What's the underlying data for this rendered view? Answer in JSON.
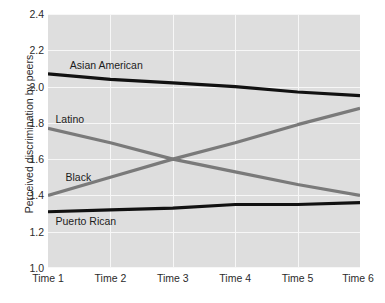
{
  "chart_data": {
    "type": "line",
    "title": "",
    "xlabel": "",
    "ylabel": "Perceived discrimination by peers",
    "categories": [
      "Time 1",
      "Time 2",
      "Time 3",
      "Time 4",
      "Time 5",
      "Time 6"
    ],
    "ylim": [
      1.0,
      2.4
    ],
    "yticks": [
      "1.0",
      "1.2",
      "1.4",
      "1.6",
      "1.8",
      "2.0",
      "2.2",
      "2.4"
    ],
    "ytick_values": [
      1.0,
      1.2,
      1.4,
      1.6,
      1.8,
      2.0,
      2.2,
      2.4
    ],
    "grid": true,
    "legend_position": "inline-labels",
    "plot_background": "#dedede",
    "gridline_color": "#f7f7f7",
    "series": [
      {
        "name": "Asian American",
        "color": "#111111",
        "values": [
          2.07,
          2.04,
          2.02,
          2.0,
          1.97,
          1.95
        ]
      },
      {
        "name": "Latino",
        "color": "#7a7a7a",
        "values": [
          1.77,
          1.69,
          1.6,
          1.53,
          1.46,
          1.4
        ]
      },
      {
        "name": "Black",
        "color": "#7a7a7a",
        "values": [
          1.4,
          1.5,
          1.6,
          1.69,
          1.79,
          1.88
        ]
      },
      {
        "name": "Puerto Rican",
        "color": "#111111",
        "values": [
          1.31,
          1.32,
          1.33,
          1.35,
          1.35,
          1.36
        ]
      }
    ],
    "annotations": [
      {
        "text": "Asian American",
        "series": "Asian American",
        "x_index": 0.35,
        "y_value": 2.12
      },
      {
        "text": "Latino",
        "series": "Latino",
        "x_index": 0.12,
        "y_value": 1.82
      },
      {
        "text": "Black",
        "series": "Black",
        "x_index": 0.28,
        "y_value": 1.5
      },
      {
        "text": "Puerto Rican",
        "series": "Puerto Rican",
        "x_index": 0.12,
        "y_value": 1.26
      }
    ]
  }
}
